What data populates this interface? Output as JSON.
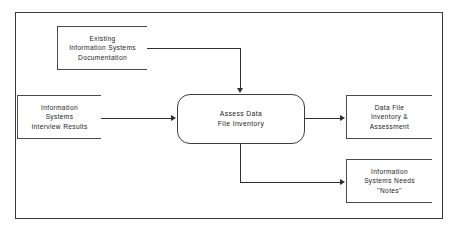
{
  "diagram": {
    "type": "data-flow-diagram",
    "frame": {
      "name": "outer-frame"
    },
    "process": {
      "id": "assess-data-file-inventory",
      "shape": "rounded-rectangle",
      "lines": [
        "Assess Data",
        "File Inventory"
      ]
    },
    "inputs": [
      {
        "id": "existing-information-systems-documentation",
        "shape": "open-ended-box",
        "lines": [
          "Existing",
          "Information  Systems",
          "Documentation"
        ]
      },
      {
        "id": "information-systems-interview-results",
        "shape": "open-ended-box",
        "lines": [
          "Information",
          "Systems",
          "Interview  Results"
        ]
      }
    ],
    "outputs": [
      {
        "id": "data-file-inventory-and-assessment",
        "shape": "open-ended-box",
        "lines": [
          "Data File",
          "Inventory &",
          "Assessment"
        ]
      },
      {
        "id": "information-systems-needs-notes",
        "shape": "open-ended-box",
        "lines": [
          "Information",
          "Systems Needs",
          "\"Notes\""
        ]
      }
    ],
    "flows": [
      {
        "id": "flow-documentation-to-process",
        "from": "existing-information-systems-documentation",
        "to": "assess-data-file-inventory",
        "path": "right-then-down",
        "label": ""
      },
      {
        "id": "flow-interview-results-to-process",
        "from": "information-systems-interview-results",
        "to": "assess-data-file-inventory",
        "path": "right",
        "label": ""
      },
      {
        "id": "flow-process-to-inventory",
        "from": "assess-data-file-inventory",
        "to": "data-file-inventory-and-assessment",
        "path": "right",
        "label": ""
      },
      {
        "id": "flow-process-to-notes",
        "from": "assess-data-file-inventory",
        "to": "information-systems-needs-notes",
        "path": "down-then-right",
        "label": ""
      }
    ],
    "colors": {
      "background": "#ffffff",
      "frame_stroke": "#3a3a3a",
      "box_stroke": "#4a4a4a",
      "flow_stroke": "#2f2f2f",
      "text": "#1b1b1b"
    }
  }
}
